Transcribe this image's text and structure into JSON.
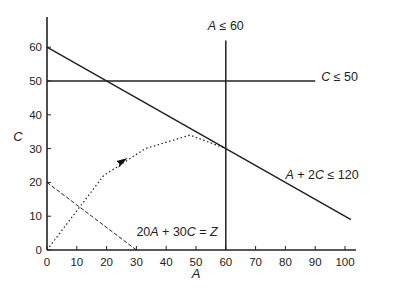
{
  "chart_data": {
    "type": "line",
    "title": "",
    "xlabel": "A",
    "ylabel": "C",
    "xlim": [
      0,
      103
    ],
    "ylim": [
      0,
      68
    ],
    "grid": false,
    "x_ticks": [
      0,
      10,
      20,
      30,
      40,
      50,
      60,
      70,
      80,
      90,
      100
    ],
    "y_ticks": [
      0,
      10,
      20,
      30,
      40,
      50,
      60
    ],
    "series": [
      {
        "name": "A + 2C ≤ 120",
        "style": "solid",
        "points": [
          [
            0,
            60
          ],
          [
            102,
            9
          ]
        ]
      },
      {
        "name": "C ≤ 50",
        "style": "solid",
        "points": [
          [
            0,
            50
          ],
          [
            90,
            50
          ]
        ]
      },
      {
        "name": "A ≤ 60",
        "style": "solid",
        "points": [
          [
            60,
            0
          ],
          [
            60,
            62
          ]
        ]
      },
      {
        "name": "20A + 30C = Z",
        "style": "dashed",
        "points": [
          [
            0,
            20
          ],
          [
            30,
            0
          ]
        ]
      },
      {
        "name": "search path",
        "style": "dotted",
        "points": [
          [
            0,
            0
          ],
          [
            19,
            22
          ],
          [
            33,
            30
          ],
          [
            48,
            34
          ],
          [
            60,
            30
          ]
        ],
        "arrow_at": [
          25,
          26
        ]
      }
    ],
    "annotations": [
      {
        "text_italic": "A",
        "text": " ≤ 60",
        "at": [
          60,
          65
        ]
      },
      {
        "text_italic": "C",
        "text": " ≤ 50",
        "at": [
          92,
          50
        ]
      },
      {
        "text": "A + 2C ≤ 120",
        "at": [
          80,
          21
        ]
      },
      {
        "text": "20A + 30C = Z",
        "at": [
          30,
          4
        ]
      }
    ]
  }
}
